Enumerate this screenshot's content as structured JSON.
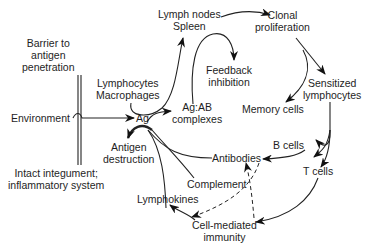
{
  "diagram": {
    "type": "flow",
    "title": "",
    "nodes": [
      {
        "id": "barrier",
        "lines": [
          "Barrier to",
          "antigen",
          "penetration"
        ]
      },
      {
        "id": "environment",
        "lines": [
          "Environment"
        ]
      },
      {
        "id": "intact",
        "lines": [
          "Intact integument;",
          "inflammatory system"
        ]
      },
      {
        "id": "lymph_nodes",
        "lines": [
          "Lymph nodes",
          "Spleen"
        ]
      },
      {
        "id": "clonal",
        "lines": [
          "Clonal",
          "proliferation"
        ]
      },
      {
        "id": "lympho_macro",
        "lines": [
          "Lymphocytes",
          "Macrophages"
        ]
      },
      {
        "id": "feedback",
        "lines": [
          "Feedback",
          "inhibition"
        ]
      },
      {
        "id": "ag",
        "lines": [
          "Ag"
        ]
      },
      {
        "id": "agab",
        "lines": [
          "Ag:AB",
          "complexes"
        ]
      },
      {
        "id": "sensitized",
        "lines": [
          "Sensitized",
          "lymphocytes"
        ]
      },
      {
        "id": "memory",
        "lines": [
          "Memory cells"
        ]
      },
      {
        "id": "antigen_destruction",
        "lines": [
          "Antigen",
          "destruction"
        ]
      },
      {
        "id": "antibodies",
        "lines": [
          "Antibodies"
        ]
      },
      {
        "id": "b_cells",
        "lines": [
          "B cells"
        ]
      },
      {
        "id": "t_cells",
        "lines": [
          "T cells"
        ]
      },
      {
        "id": "complement",
        "lines": [
          "Complement"
        ]
      },
      {
        "id": "lymphokines",
        "lines": [
          "Lymphokines"
        ]
      },
      {
        "id": "cmi",
        "lines": [
          "Cell-mediated",
          "immunity"
        ]
      }
    ],
    "edges": [
      {
        "from": "environment",
        "to": "ag",
        "style": "solid"
      },
      {
        "from": "lympho_macro",
        "to": "lymph_nodes",
        "style": "solid"
      },
      {
        "from": "lymph_nodes",
        "to": "clonal",
        "style": "solid"
      },
      {
        "from": "agab",
        "to": "feedback",
        "style": "solid"
      },
      {
        "from": "ag",
        "to": "agab",
        "style": "solid"
      },
      {
        "from": "clonal",
        "to": "sensitized",
        "style": "solid"
      },
      {
        "from": "clonal",
        "to": "memory",
        "style": "solid"
      },
      {
        "from": "sensitized",
        "to": "b_cells",
        "style": "solid"
      },
      {
        "from": "sensitized",
        "to": "t_cells",
        "style": "solid"
      },
      {
        "from": "b_cells",
        "to": "antibodies",
        "style": "solid"
      },
      {
        "from": "t_cells",
        "to": "cmi",
        "style": "solid"
      },
      {
        "from": "antibodies",
        "to": "antigen_destruction",
        "style": "solid"
      },
      {
        "from": "complement",
        "to": "antigen_destruction",
        "style": "solid"
      },
      {
        "from": "lymphokines",
        "to": "antigen_destruction",
        "style": "solid"
      },
      {
        "from": "cmi",
        "to": "lymphokines",
        "style": "solid"
      },
      {
        "from": "antibodies",
        "to": "cmi",
        "style": "dashed"
      },
      {
        "from": "cmi",
        "to": "antibodies",
        "style": "dashed"
      }
    ]
  }
}
